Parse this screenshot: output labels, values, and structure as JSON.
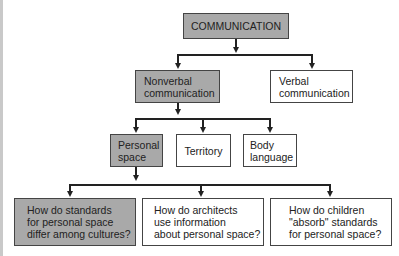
{
  "diagram": {
    "root": {
      "label": "COMMUNICATION",
      "shaded": true
    },
    "level1": [
      {
        "label": "Nonverbal\ncommunication",
        "shaded": true
      },
      {
        "label": "Verbal\ncommunication",
        "shaded": false
      }
    ],
    "level2": [
      {
        "label": "Personal\nspace",
        "shaded": true
      },
      {
        "label": "Territory",
        "shaded": false
      },
      {
        "label": "Body\nlanguage",
        "shaded": false
      }
    ],
    "level3": [
      {
        "label": "How do standards\nfor personal space\ndiffer among cultures?",
        "shaded": true
      },
      {
        "label": "How do architects\nuse information\nabout personal space?",
        "shaded": false
      },
      {
        "label": "How do children\n\"absorb\" standards\nfor personal space?",
        "shaded": false
      }
    ],
    "colors": {
      "shaded_fill": "#a9a9a9",
      "plain_fill": "#ffffff",
      "line": "#222222"
    }
  }
}
